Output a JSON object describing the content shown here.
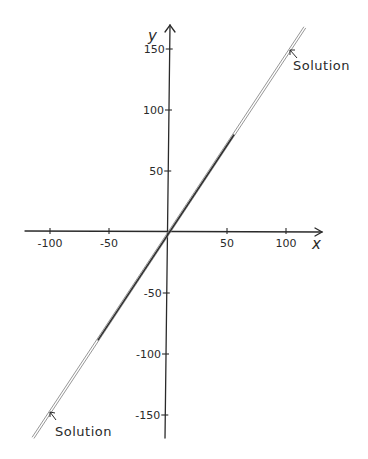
{
  "chart_data": {
    "type": "line",
    "title": "",
    "xlabel": "x",
    "ylabel": "y",
    "xlim": [
      -120,
      130
    ],
    "ylim": [
      -170,
      170
    ],
    "grid": false,
    "legend": null,
    "x_ticks": [
      -100,
      -50,
      50,
      100
    ],
    "x_tick_labels": [
      "-100",
      "-50",
      "50",
      "100"
    ],
    "y_ticks": [
      150,
      100,
      50,
      -50,
      -100,
      -150
    ],
    "y_tick_labels": [
      "150",
      "100",
      "50",
      "-50",
      "-100",
      "-150"
    ],
    "series": [
      {
        "name": "Solution",
        "style": "double line",
        "x": [
          -115,
          0,
          115
        ],
        "y": [
          -168,
          0,
          168
        ]
      }
    ],
    "annotations": [
      {
        "text": "Solution",
        "arrow_to": [
          104,
          152
        ],
        "position": "upper-right"
      },
      {
        "text": "Solution",
        "arrow_to": [
          -100,
          -148
        ],
        "position": "lower-left"
      }
    ]
  },
  "labels": {
    "x_axis": "x",
    "y_axis": "y",
    "annotation_top": "Solution",
    "annotation_bottom": "Solution"
  },
  "colors": {
    "ink": "#2a2a2a",
    "line_light": "#8a8a8a",
    "background": "#ffffff"
  }
}
